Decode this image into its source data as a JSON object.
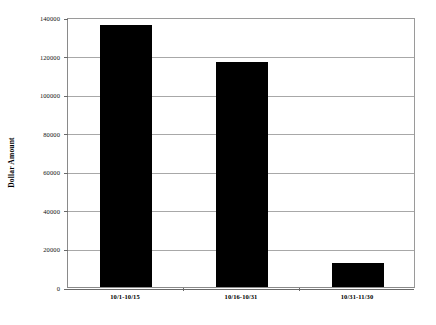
{
  "chart_data": {
    "type": "bar",
    "title": "",
    "subtitle": "",
    "xlabel": "",
    "ylabel": "Dollar Amount",
    "categories": [
      "10/1-10/15",
      "10/16-10/31",
      "10/31-11/30"
    ],
    "values": [
      136000,
      116500,
      12700
    ],
    "series": [
      {
        "name": "Dollar Amount",
        "values": [
          136000,
          116500,
          12700
        ],
        "color": "#000000"
      }
    ],
    "ylim": [
      0,
      140000
    ],
    "xlim": [
      0,
      3
    ],
    "ytick_values": [
      0,
      20000,
      40000,
      60000,
      80000,
      100000,
      120000,
      140000
    ],
    "ytick_labels": [
      "0",
      "20000",
      "40000",
      "60000",
      "80000",
      "100000",
      "120000",
      "140000"
    ],
    "grid": true,
    "grid_axis": "y",
    "legend": false,
    "legend_position": "none",
    "bar_color": "#000000",
    "plot_background": "#ffffff",
    "figure_background": "#ffffff",
    "axis_color": "#8a8a8a",
    "gridline_color": "#a8a8a8",
    "annotations": []
  }
}
